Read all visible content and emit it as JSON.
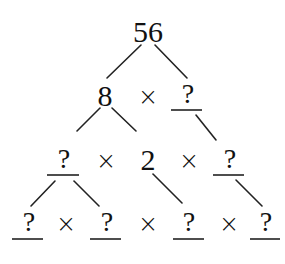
{
  "diagram": {
    "type": "factor-tree",
    "operator_symbol": "×",
    "unknown_symbol": "?",
    "root": {
      "value": "56"
    },
    "row2": {
      "left": "8",
      "op": "×",
      "right": "?"
    },
    "row3": {
      "a": "?",
      "op1": "×",
      "b": "2",
      "op2": "×",
      "c": "?"
    },
    "row4": {
      "a": "?",
      "op1": "×",
      "b": "?",
      "op2": "×",
      "c": "?",
      "op3": "×",
      "d": "?"
    }
  }
}
